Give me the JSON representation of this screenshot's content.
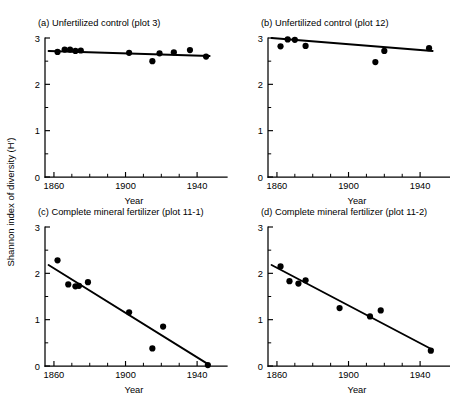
{
  "figure": {
    "ylabel": "Shannon index of diversity (H′)",
    "xlabel": "Year",
    "background": "#ffffff",
    "ink": "#000000"
  },
  "axes": {
    "x": {
      "min": 1855,
      "max": 1950,
      "major_ticks": [
        1860,
        1900,
        1940
      ],
      "major_tick_labels": [
        "1860",
        "1900",
        "1940"
      ],
      "minor_ticks": [
        1870,
        1880,
        1890,
        1910,
        1920,
        1930
      ],
      "title": "Year"
    },
    "y": {
      "min": 0,
      "max": 3,
      "major_ticks": [
        0,
        1,
        2,
        3
      ],
      "major_tick_labels": [
        "0",
        "1",
        "2",
        "3"
      ],
      "minor_ticks": [
        0.5,
        1.5,
        2.5
      ]
    }
  },
  "chart_data": [
    {
      "type": "scatter",
      "panel": "a",
      "title": "(a) Unfertilized control (plot 3)",
      "xlabel": "Year",
      "ylabel": "Shannon index of diversity (H′)",
      "xlim": [
        1855,
        1950
      ],
      "ylim": [
        0,
        3
      ],
      "grid": false,
      "legend": "none",
      "x": [
        1862,
        1866,
        1869,
        1872,
        1875,
        1902,
        1915,
        1919,
        1927,
        1936,
        1945
      ],
      "y": [
        2.7,
        2.75,
        2.75,
        2.72,
        2.73,
        2.68,
        2.5,
        2.67,
        2.69,
        2.74,
        2.6
      ],
      "trend_line": {
        "x": [
          1857,
          1947
        ],
        "y": [
          2.72,
          2.61
        ]
      }
    },
    {
      "type": "scatter",
      "panel": "b",
      "title": "(b) Unfertilized control (plot 12)",
      "xlabel": "Year",
      "ylabel": "Shannon index of diversity (H′)",
      "xlim": [
        1855,
        1950
      ],
      "ylim": [
        0,
        3
      ],
      "grid": false,
      "legend": "none",
      "x": [
        1862,
        1866,
        1870,
        1876,
        1915,
        1920,
        1945
      ],
      "y": [
        2.82,
        2.97,
        2.96,
        2.83,
        2.48,
        2.72,
        2.78
      ],
      "trend_line": {
        "x": [
          1857,
          1947
        ],
        "y": [
          3.0,
          2.72
        ]
      }
    },
    {
      "type": "scatter",
      "panel": "c",
      "title": "(c) Complete mineral fertilizer (plot 11-1)",
      "xlabel": "Year",
      "ylabel": "Shannon index of diversity (H′)",
      "xlim": [
        1855,
        1950
      ],
      "ylim": [
        0,
        3
      ],
      "grid": false,
      "legend": "none",
      "x": [
        1862,
        1868,
        1872,
        1874,
        1879,
        1902,
        1915,
        1921,
        1946
      ],
      "y": [
        2.28,
        1.76,
        1.72,
        1.73,
        1.81,
        1.16,
        0.38,
        0.85,
        0.02
      ],
      "trend_line": {
        "x": [
          1857,
          1947
        ],
        "y": [
          2.18,
          0.02
        ]
      }
    },
    {
      "type": "scatter",
      "panel": "d",
      "title": "(d) Complete mineral fertilizer (plot 11-2)",
      "xlabel": "Year",
      "ylabel": "Shannon index of diversity (H′)",
      "xlim": [
        1855,
        1950
      ],
      "ylim": [
        0,
        3
      ],
      "grid": false,
      "legend": "none",
      "x": [
        1862,
        1867,
        1872,
        1876,
        1895,
        1912,
        1918,
        1946
      ],
      "y": [
        2.15,
        1.83,
        1.78,
        1.85,
        1.25,
        1.07,
        1.2,
        0.33
      ],
      "trend_line": {
        "x": [
          1857,
          1947
        ],
        "y": [
          2.18,
          0.35
        ]
      }
    }
  ]
}
